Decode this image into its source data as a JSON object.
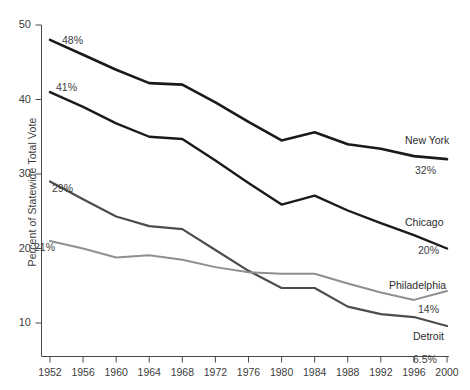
{
  "chart_data": {
    "type": "line",
    "title": "",
    "subtitle": "",
    "xlabel": "",
    "ylabel": "Percent of Statewide Total Vote",
    "x": [
      1952,
      1956,
      1960,
      1964,
      1968,
      1972,
      1976,
      1980,
      1984,
      1988,
      1992,
      1996,
      2000
    ],
    "categories": [
      "1952",
      "1956",
      "1960",
      "1964",
      "1968",
      "1972",
      "1976",
      "1980",
      "1984",
      "1988",
      "1992",
      "1996",
      "2000"
    ],
    "xlim": [
      1952,
      2000
    ],
    "ylim": [
      6,
      50
    ],
    "yticks": [
      10,
      20,
      30,
      40,
      50
    ],
    "ytick_labels": [
      "10",
      "20",
      "30",
      "40",
      "50"
    ],
    "xticks": [
      1952,
      1956,
      1960,
      1964,
      1968,
      1972,
      1976,
      1980,
      1984,
      1988,
      1992,
      1996,
      2000
    ],
    "grid": false,
    "legend_position": "right-inline",
    "series": [
      {
        "name": "New York",
        "color": "#1a1a1a",
        "width": 2.6,
        "start_label": "48%",
        "end_label": "32%",
        "values": [
          48.0,
          46.0,
          44.0,
          42.2,
          42.0,
          39.6,
          37.0,
          34.5,
          35.6,
          34.0,
          33.4,
          32.4,
          32.0
        ]
      },
      {
        "name": "Chicago",
        "color": "#1a1a1a",
        "width": 2.4,
        "start_label": "41%",
        "end_label": "20%",
        "values": [
          41.0,
          39.0,
          36.8,
          35.0,
          34.7,
          31.8,
          28.8,
          25.9,
          27.1,
          25.1,
          23.4,
          21.8,
          20.0
        ]
      },
      {
        "name": "Detroit",
        "color": "#4d4d4d",
        "width": 2.2,
        "start_label": "29%",
        "end_label": "6.5%",
        "values": [
          29.0,
          26.6,
          24.3,
          23.0,
          22.6,
          19.8,
          17.0,
          14.7,
          14.7,
          12.2,
          11.2,
          10.8,
          9.6
        ]
      },
      {
        "name": "Philadelphia",
        "color": "#8f8f8f",
        "width": 2.0,
        "start_label": "21%",
        "end_label": "14%",
        "values": [
          21.0,
          20.0,
          18.8,
          19.1,
          18.5,
          17.5,
          16.8,
          16.6,
          16.6,
          15.3,
          14.1,
          13.1,
          14.3
        ]
      }
    ]
  },
  "axis": {
    "y_title": "Percent of Statewide Total Vote"
  }
}
